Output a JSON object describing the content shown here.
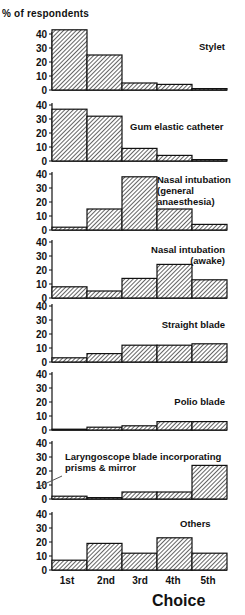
{
  "chart_data": {
    "type": "bar",
    "title": "",
    "ylabel": "% of respondents",
    "xlabel": "Choice",
    "categories": [
      "1st",
      "2nd",
      "3rd",
      "4th",
      "5th"
    ],
    "ylim": [
      0,
      40
    ],
    "yticks": [
      0,
      10,
      20,
      30,
      40
    ],
    "grid": false,
    "style": "hatched step histogram, small multiples stacked vertically",
    "series": [
      {
        "name": "Stylet",
        "label_lines": [
          "Stylet"
        ],
        "values": [
          43,
          25,
          5,
          4,
          1
        ]
      },
      {
        "name": "Gum elastic catheter",
        "label_lines": [
          "Gum elastic catheter"
        ],
        "values": [
          37,
          32,
          9,
          4,
          1
        ]
      },
      {
        "name": "Nasal intubation (general anaesthesia)",
        "label_lines": [
          "Nasal intubation",
          "(general",
          "anaesthesia)"
        ],
        "values": [
          2,
          15,
          38,
          15,
          4
        ]
      },
      {
        "name": "Nasal intubation (awake)",
        "label_lines": [
          "Nasal intubation",
          "(awake)"
        ],
        "values": [
          8,
          5,
          14,
          24,
          13
        ]
      },
      {
        "name": "Straight blade",
        "label_lines": [
          "Straight blade"
        ],
        "values": [
          3,
          6,
          12,
          12,
          13
        ]
      },
      {
        "name": "Polio blade",
        "label_lines": [
          "Polio blade"
        ],
        "values": [
          0,
          2,
          3,
          6,
          6
        ]
      },
      {
        "name": "Laryngoscope blade incorporating prisms & mirror",
        "label_lines": [
          "Laryngoscope blade incorporating",
          "prisms & mirror"
        ],
        "values": [
          2,
          1,
          5,
          5,
          24
        ]
      },
      {
        "name": "Others",
        "label_lines": [
          "Others"
        ],
        "values": [
          7,
          19,
          12,
          23,
          12
        ]
      }
    ]
  },
  "layout": {
    "axis_x": 52,
    "bar_width": 35,
    "panel_zero_y": [
      90,
      161,
      230,
      298,
      362,
      430,
      499,
      570
    ],
    "panel_height_px_for_40": 56,
    "label_positions": [
      {
        "x": 199,
        "y": 50,
        "anchor": "start"
      },
      {
        "x": 130,
        "y": 130,
        "anchor": "start"
      },
      {
        "x": 157,
        "y": 183,
        "anchor": "start"
      },
      {
        "x": 225,
        "y": 253,
        "anchor": "end"
      },
      {
        "x": 225,
        "y": 328,
        "anchor": "end"
      },
      {
        "x": 225,
        "y": 405,
        "anchor": "end"
      },
      {
        "x": 65,
        "y": 460,
        "anchor": "start"
      },
      {
        "x": 180,
        "y": 527,
        "anchor": "start"
      }
    ],
    "x_tick_positions": [
      67,
      106,
      140,
      173,
      208
    ]
  }
}
